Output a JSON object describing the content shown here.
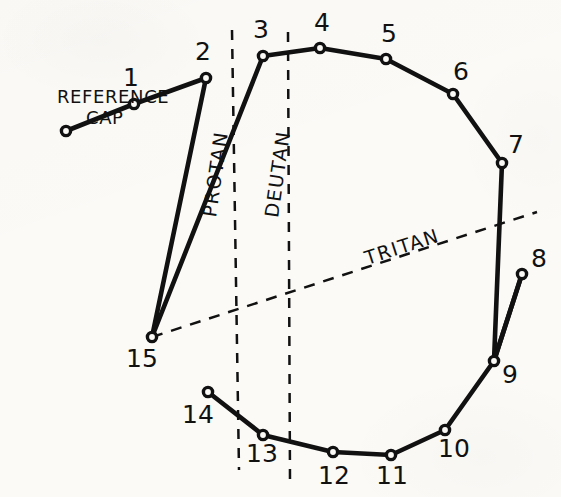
{
  "figure": {
    "type": "farnsworth-d15-dichotomous-plot",
    "background_color": "#fbfaf7",
    "ink_color": "#111111",
    "width": 561,
    "height": 497
  },
  "reference": {
    "label_line1": "REFERENCE",
    "label_line2": "CAP",
    "label_x": 57,
    "label_y": 103,
    "label2_x": 86,
    "label2_y": 124,
    "point": {
      "x": 66,
      "y": 131
    }
  },
  "caps": [
    {
      "id": "1",
      "x": 134,
      "y": 104,
      "label_x": 131,
      "label_y": 86,
      "anchor": "middle"
    },
    {
      "id": "2",
      "x": 206,
      "y": 78,
      "label_x": 203,
      "label_y": 60,
      "anchor": "middle"
    },
    {
      "id": "3",
      "x": 263,
      "y": 56,
      "label_x": 261,
      "label_y": 38,
      "anchor": "middle"
    },
    {
      "id": "4",
      "x": 320,
      "y": 48,
      "label_x": 322,
      "label_y": 31,
      "anchor": "middle"
    },
    {
      "id": "5",
      "x": 386,
      "y": 59,
      "label_x": 389,
      "label_y": 42,
      "anchor": "middle"
    },
    {
      "id": "6",
      "x": 453,
      "y": 94,
      "label_x": 461,
      "label_y": 80,
      "anchor": "middle"
    },
    {
      "id": "7",
      "x": 502,
      "y": 163,
      "label_x": 516,
      "label_y": 153,
      "anchor": "middle"
    },
    {
      "id": "8",
      "x": 522,
      "y": 274,
      "label_x": 539,
      "label_y": 267,
      "anchor": "middle"
    },
    {
      "id": "9",
      "x": 494,
      "y": 361,
      "label_x": 510,
      "label_y": 383,
      "anchor": "middle"
    },
    {
      "id": "10",
      "x": 445,
      "y": 430,
      "label_x": 454,
      "label_y": 457,
      "anchor": "middle"
    },
    {
      "id": "11",
      "x": 391,
      "y": 455,
      "label_x": 392,
      "label_y": 484,
      "anchor": "middle"
    },
    {
      "id": "12",
      "x": 333,
      "y": 452,
      "label_x": 334,
      "label_y": 484,
      "anchor": "middle"
    },
    {
      "id": "13",
      "x": 263,
      "y": 435,
      "label_x": 262,
      "label_y": 462,
      "anchor": "middle"
    },
    {
      "id": "14",
      "x": 208,
      "y": 392,
      "label_x": 198,
      "label_y": 423,
      "anchor": "middle"
    },
    {
      "id": "15",
      "x": 152,
      "y": 337,
      "label_x": 142,
      "label_y": 367,
      "anchor": "middle"
    }
  ],
  "path_order": [
    "REF",
    "1",
    "2",
    "15",
    "3",
    "4",
    "5",
    "6",
    "7",
    "9",
    "8",
    "9",
    "10",
    "11",
    "12",
    "13",
    "14"
  ],
  "segments": [
    {
      "from": "REF",
      "to": "1"
    },
    {
      "from": "1",
      "to": "2"
    },
    {
      "from": "2",
      "to": "15"
    },
    {
      "from": "15",
      "to": "3"
    },
    {
      "from": "3",
      "to": "4"
    },
    {
      "from": "4",
      "to": "5"
    },
    {
      "from": "5",
      "to": "6"
    },
    {
      "from": "6",
      "to": "7"
    },
    {
      "from": "7",
      "to": "9"
    },
    {
      "from": "9",
      "to": "8"
    },
    {
      "from": "8",
      "to": "9"
    },
    {
      "from": "9",
      "to": "10"
    },
    {
      "from": "10",
      "to": "11"
    },
    {
      "from": "11",
      "to": "12"
    },
    {
      "from": "12",
      "to": "13"
    },
    {
      "from": "13",
      "to": "14"
    }
  ],
  "confusion_axes": [
    {
      "name": "PROTAN",
      "x1": 232,
      "y1": 30,
      "x2": 239,
      "y2": 470,
      "dash": "10 9",
      "label_x": 222,
      "label_y": 175,
      "label_rotate": -82
    },
    {
      "name": "DEUTAN",
      "x1": 288,
      "y1": 32,
      "x2": 290,
      "y2": 480,
      "dash": "10 9",
      "label_x": 284,
      "label_y": 175,
      "label_rotate": -82
    },
    {
      "name": "TRITAN",
      "x1": 152,
      "y1": 337,
      "x2": 537,
      "y2": 212,
      "dash": "11 9",
      "label_x": 404,
      "label_y": 253,
      "label_rotate": -18
    }
  ],
  "chart_data": {
    "type": "line",
    "xlabel": "",
    "ylabel": "",
    "grid": false,
    "legend_position": "none",
    "categories": [
      "REFERENCE CAP",
      "1",
      "2",
      "3",
      "4",
      "5",
      "6",
      "7",
      "8",
      "9",
      "10",
      "11",
      "12",
      "13",
      "14",
      "15"
    ],
    "annotations": [
      "REFERENCE CAP",
      "PROTAN",
      "DEUTAN",
      "TRITAN"
    ],
    "series": [
      {
        "name": "cap arrangement order",
        "points": [
          {
            "cap": "REFERENCE CAP",
            "x": 66,
            "y": 131
          },
          {
            "cap": "1",
            "x": 134,
            "y": 104
          },
          {
            "cap": "2",
            "x": 206,
            "y": 78
          },
          {
            "cap": "15",
            "x": 152,
            "y": 337
          },
          {
            "cap": "3",
            "x": 263,
            "y": 56
          },
          {
            "cap": "4",
            "x": 320,
            "y": 48
          },
          {
            "cap": "5",
            "x": 386,
            "y": 59
          },
          {
            "cap": "6",
            "x": 453,
            "y": 94
          },
          {
            "cap": "7",
            "x": 502,
            "y": 163
          },
          {
            "cap": "9",
            "x": 494,
            "y": 361
          },
          {
            "cap": "8",
            "x": 522,
            "y": 274
          },
          {
            "cap": "9",
            "x": 494,
            "y": 361
          },
          {
            "cap": "10",
            "x": 445,
            "y": 430
          },
          {
            "cap": "11",
            "x": 391,
            "y": 455
          },
          {
            "cap": "12",
            "x": 333,
            "y": 452
          },
          {
            "cap": "13",
            "x": 263,
            "y": 435
          },
          {
            "cap": "14",
            "x": 208,
            "y": 392
          }
        ]
      }
    ],
    "confusion_axes": [
      {
        "name": "PROTAN",
        "style": "dashed",
        "orientation": "near-vertical"
      },
      {
        "name": "DEUTAN",
        "style": "dashed",
        "orientation": "near-vertical"
      },
      {
        "name": "TRITAN",
        "style": "dashed",
        "orientation": "diagonal"
      }
    ]
  }
}
